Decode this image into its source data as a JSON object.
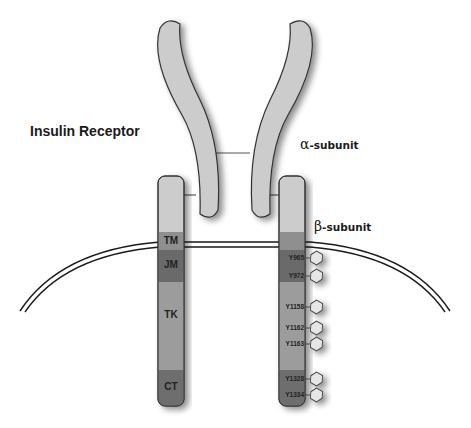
{
  "title": "Insulin Receptor",
  "labels": {
    "alpha_symbol": "α",
    "alpha_text": "-subunit",
    "beta_symbol": "β",
    "beta_text": "-subunit"
  },
  "domains": [
    {
      "key": "TM",
      "label": "TM",
      "color": "#8f8f8f"
    },
    {
      "key": "JM",
      "label": "JM",
      "color": "#6a6a6a"
    },
    {
      "key": "TK",
      "label": "TK",
      "color": "#9c9c9c"
    },
    {
      "key": "CT",
      "label": "CT",
      "color": "#6e6e6e"
    }
  ],
  "phosphotyrosines": [
    "Y965",
    "Y972",
    "Y1158",
    "Y1162",
    "Y1163",
    "Y1328",
    "Y1334"
  ],
  "colors": {
    "subunit_fill": "#cccccc",
    "outline": "#333333",
    "membrane": "#1a1a1a",
    "hexagon_fill": "#e6e6e6"
  }
}
